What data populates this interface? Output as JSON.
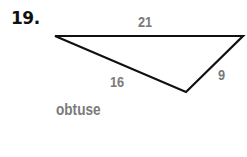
{
  "problem": {
    "number": "19.",
    "sides": {
      "top": "21",
      "left": "16",
      "right": "9"
    },
    "classification": "obtuse"
  },
  "figure": {
    "type": "triangle",
    "vertices": [
      [
        55,
        36
      ],
      [
        243,
        36
      ],
      [
        186,
        92
      ]
    ],
    "stroke_color": "#111111",
    "label_color": "#7a7a7a"
  }
}
